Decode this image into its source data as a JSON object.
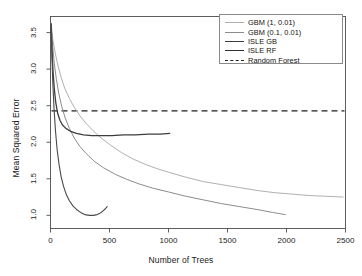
{
  "chart_data": {
    "type": "line",
    "title": "",
    "xlabel": "Number of Trees",
    "ylabel": "Mean Squared Error",
    "xlim": [
      0,
      2500
    ],
    "ylim": [
      0.82,
      3.72
    ],
    "xticks": [
      0,
      500,
      1000,
      1500,
      2000,
      2500
    ],
    "yticks": [
      1.0,
      1.5,
      2.0,
      2.5,
      3.0,
      3.5
    ],
    "ytick_labels": [
      "1.0",
      "1.5",
      "2.0",
      "2.5",
      "3.0",
      "3.5"
    ],
    "xtick_labels": [
      "0",
      "500",
      "1000",
      "1500",
      "2000",
      "2500"
    ],
    "grid": false,
    "legend_position": "top-right",
    "series": [
      {
        "name": "GBM (1, 0.01)",
        "color": "#b0b0b0",
        "style": "solid",
        "width": 1.0,
        "points": [
          [
            5,
            3.62
          ],
          [
            20,
            3.4
          ],
          [
            40,
            3.22
          ],
          [
            60,
            3.07
          ],
          [
            90,
            2.89
          ],
          [
            120,
            2.74
          ],
          [
            160,
            2.6
          ],
          [
            200,
            2.48
          ],
          [
            250,
            2.36
          ],
          [
            300,
            2.26
          ],
          [
            360,
            2.16
          ],
          [
            420,
            2.07
          ],
          [
            500,
            1.97
          ],
          [
            600,
            1.86
          ],
          [
            700,
            1.77
          ],
          [
            800,
            1.7
          ],
          [
            900,
            1.64
          ],
          [
            1000,
            1.59
          ],
          [
            1150,
            1.52
          ],
          [
            1300,
            1.46
          ],
          [
            1450,
            1.42
          ],
          [
            1600,
            1.38
          ],
          [
            1750,
            1.34
          ],
          [
            1900,
            1.31
          ],
          [
            2050,
            1.29
          ],
          [
            2200,
            1.27
          ],
          [
            2350,
            1.26
          ],
          [
            2480,
            1.25
          ]
        ]
      },
      {
        "name": "GBM (0.1, 0.01)",
        "color": "#8c8c8c",
        "style": "solid",
        "width": 1.0,
        "points": [
          [
            5,
            3.62
          ],
          [
            18,
            3.32
          ],
          [
            32,
            3.08
          ],
          [
            50,
            2.86
          ],
          [
            70,
            2.67
          ],
          [
            95,
            2.49
          ],
          [
            125,
            2.33
          ],
          [
            160,
            2.19
          ],
          [
            200,
            2.06
          ],
          [
            250,
            1.94
          ],
          [
            300,
            1.85
          ],
          [
            370,
            1.74
          ],
          [
            450,
            1.65
          ],
          [
            550,
            1.56
          ],
          [
            650,
            1.49
          ],
          [
            750,
            1.43
          ],
          [
            870,
            1.37
          ],
          [
            1000,
            1.32
          ],
          [
            1150,
            1.26
          ],
          [
            1300,
            1.21
          ],
          [
            1450,
            1.16
          ],
          [
            1600,
            1.12
          ],
          [
            1750,
            1.08
          ],
          [
            1880,
            1.04
          ],
          [
            1990,
            1.01
          ]
        ]
      },
      {
        "name": "ISLE  GB",
        "color": "#3d3d3d",
        "style": "solid",
        "width": 1.3,
        "points": [
          [
            5,
            3.62
          ],
          [
            14,
            3.22
          ],
          [
            22,
            2.96
          ],
          [
            32,
            2.73
          ],
          [
            45,
            2.54
          ],
          [
            60,
            2.4
          ],
          [
            80,
            2.3
          ],
          [
            100,
            2.24
          ],
          [
            130,
            2.19
          ],
          [
            170,
            2.15
          ],
          [
            220,
            2.12
          ],
          [
            280,
            2.1
          ],
          [
            350,
            2.09
          ],
          [
            430,
            2.09
          ],
          [
            520,
            2.09
          ],
          [
            620,
            2.1
          ],
          [
            720,
            2.1
          ],
          [
            830,
            2.11
          ],
          [
            930,
            2.11
          ],
          [
            1010,
            2.12
          ]
        ]
      },
      {
        "name": "ISLE RF",
        "color": "#4a4a4a",
        "style": "solid",
        "width": 1.1,
        "points": [
          [
            5,
            3.62
          ],
          [
            12,
            3.16
          ],
          [
            20,
            2.8
          ],
          [
            30,
            2.46
          ],
          [
            42,
            2.16
          ],
          [
            56,
            1.9
          ],
          [
            72,
            1.7
          ],
          [
            90,
            1.53
          ],
          [
            110,
            1.4
          ],
          [
            135,
            1.28
          ],
          [
            160,
            1.2
          ],
          [
            190,
            1.13
          ],
          [
            220,
            1.08
          ],
          [
            255,
            1.04
          ],
          [
            290,
            1.01
          ],
          [
            330,
            1.0
          ],
          [
            365,
            1.0
          ],
          [
            395,
            1.01
          ],
          [
            420,
            1.03
          ],
          [
            445,
            1.06
          ],
          [
            465,
            1.09
          ],
          [
            480,
            1.12
          ]
        ]
      }
    ],
    "reference_line": {
      "name": "Random Forest",
      "value": 2.43,
      "color": "#1f1f1f",
      "style": "dashed"
    },
    "legend": [
      {
        "label": "GBM (1, 0.01)",
        "color": "#b0b0b0",
        "style": "solid",
        "width": 1.2
      },
      {
        "label": "GBM (0.1, 0.01)",
        "color": "#8c8c8c",
        "style": "solid",
        "width": 1.2
      },
      {
        "label": "ISLE  GB",
        "color": "#3d3d3d",
        "style": "solid",
        "width": 1.5
      },
      {
        "label": "ISLE RF",
        "color": "#2e2e2e",
        "style": "solid",
        "width": 1.5
      },
      {
        "label": "Random Forest",
        "color": "#1f1f1f",
        "style": "dashed",
        "width": 1.2
      }
    ]
  }
}
